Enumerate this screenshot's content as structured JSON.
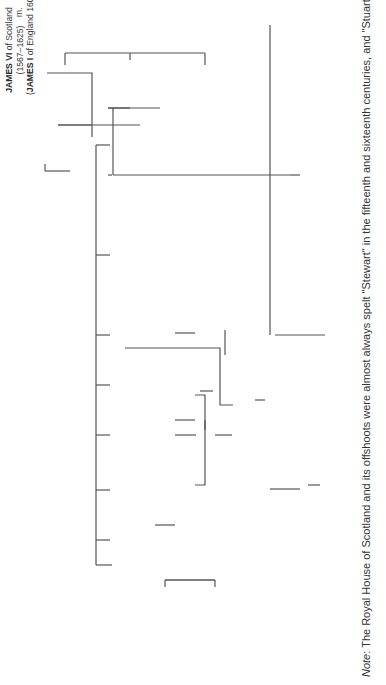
{
  "diagram": {
    "type": "family-tree",
    "orientation": "rotated-90-ccw",
    "people": {
      "james_vi": {
        "name": "JAMES VI",
        "suffix": " of Scotland",
        "dates": "(1567–1625)",
        "alt_name": "JAMES I",
        "alt_suffix": " of England 1603–25"
      },
      "anne_denmark": {
        "name": "Anne of Denmark",
        "dates": "(d. 1619)"
      },
      "henry_wales": {
        "name": "Henry,",
        "line2": "Prince of Wales",
        "dates": "(d. 1612)"
      },
      "elizabeth": {
        "name": "Elizabeth",
        "dates": "(d. 1662)"
      },
      "frederick_v": {
        "name": "Frederick V,",
        "line2": "Elector Palatine of the Rhine",
        "dates": "(d. 1632)"
      },
      "charles_i": {
        "name": "CHARLES I",
        "dates": "(1625–49)"
      },
      "henrietta_maria": {
        "name": "Henrietta Maria",
        "line2": "(dr. of Henry IV of France)",
        "dates": "(d.1669)"
      },
      "charles_ii": {
        "name": "CHARLES II",
        "dates": "(1649/60–1685)"
      },
      "catherine_braganza": {
        "name": "Catherine of Braganza",
        "dates": "(d. 1705)"
      },
      "mary": {
        "name": "Mary",
        "dates": "(d. 1660)"
      },
      "william_ii_orange": {
        "name": "William II of Orange",
        "dates": "(d. 1650)"
      },
      "james_ii": {
        "name": "JAMES II",
        "dates": "(1685–abdic. 1688; d. 1701)",
        "alt_name": "JAMES VII",
        "alt_suffix": " of Scotland"
      },
      "anne_hyde": {
        "name": "(1) Anne Hyde",
        "dates": "(d.1671)"
      },
      "mary_modena": {
        "name": "(2) Mary",
        "line2": "of Modena",
        "dates": "(d. 1718)"
      },
      "elizabeth_1650": {
        "name": "Elizabeth",
        "dates": "(d. 1650)"
      },
      "anne_1640": {
        "name": "Anne",
        "dates": "(d. 1640)"
      },
      "henry_gloucester": {
        "name": "Henry,",
        "line2": "duke of Gloucester",
        "dates": "(d. 1660)"
      },
      "henrietta_anne": {
        "name": "Henrietta Anne",
        "dates": "(d. 1670)"
      },
      "philippe": {
        "line1": "Philippe d'Orléans,",
        "line2": "brother of Louis XIV",
        "dates": "(d. 1701)"
      },
      "anne_marie": {
        "name": "Anne Marie d'Orléans"
      },
      "savoy": {
        "name": "Savoy line"
      },
      "william_iii": {
        "name": "WILLIAM III",
        "dates": "(1689–1702)",
        "note": "(r. alone from 1694)"
      },
      "mary_ii": {
        "name": "MARY II",
        "dates": "(1689–94)"
      },
      "anne_queen": {
        "name": "ANNE",
        "dates": "(1702–14)"
      },
      "george_denmark": {
        "name": "George",
        "line2": "of Denmark",
        "dates": "(d. 1708)"
      },
      "james_francis": {
        "name": "James Francis Edward",
        "line2": "Stuart (Old Pretender)",
        "dates": "(d. 1766)"
      },
      "charles_edward": {
        "name": "Charles Edward",
        "line2": "(Young Pretender)",
        "dates": "(d. 1788)"
      },
      "henry_york": {
        "name": "Henry,",
        "line2": "Cardinal of York",
        "dates": "(d. 1807)"
      },
      "charles_louis": {
        "name": "Charles Louis",
        "dates": "(d. 1680)"
      },
      "rupert": {
        "name": "Rupert",
        "dates": "(d. 1682)"
      },
      "sophia": {
        "name": "Sophia",
        "dates": "(d. 1714)"
      },
      "ernest_augustus": {
        "name": "Ernest Augustus,",
        "line2": "Elector of Hanover",
        "dates": "(d. 1698)"
      },
      "george_i": {
        "name": "GEORGE I",
        "dates": "(1714–27)"
      },
      "sophia_dorothea": {
        "name": "Sophia Dorothea of Brunswick and Zelle",
        "dates": "(d. 1726)"
      }
    },
    "marriage_label": "m.",
    "note": {
      "prefix": "Note",
      "text": ": The Royal House of Scotland and its offshoots were almost always spelt \"Stewart\" in the fifteenth and sixteenth centuries, and \"Stuart\""
    }
  }
}
